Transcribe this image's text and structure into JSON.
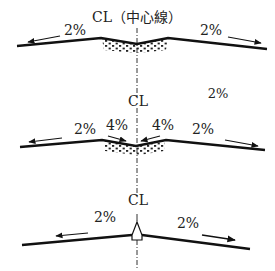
{
  "diagram": {
    "colors": {
      "line": "#111111",
      "text": "#222222",
      "gravel": "#222222",
      "background": "#ffffff"
    },
    "centerline": {
      "label_top": "CL（中心線）",
      "label_mid": "CL",
      "label_bottom": "CL"
    },
    "sections": [
      {
        "name": "depressed-center-gravel",
        "left_slope": "2%",
        "right_slope": "2%"
      },
      {
        "name": "depressed-center-steep",
        "floating_label": "2%",
        "outer_left_slope": "2%",
        "inner_left_slope": "4%",
        "inner_right_slope": "4%",
        "outer_right_slope": "2%"
      },
      {
        "name": "crowned-center",
        "left_slope": "2%",
        "right_slope": "2%"
      }
    ]
  }
}
